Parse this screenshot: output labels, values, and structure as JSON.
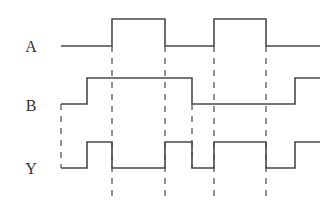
{
  "diagram": {
    "type": "timing-diagram",
    "colors": {
      "line": "#4a4a4a",
      "label": "#333333",
      "background": "#ffffff"
    },
    "signals": [
      {
        "name": "A",
        "label_pos": [
          31,
          52
        ],
        "high_y": 19,
        "low_y": 46,
        "points": [
          [
            61,
            46
          ],
          [
            112,
            46
          ],
          [
            112,
            19
          ],
          [
            165,
            19
          ],
          [
            165,
            46
          ],
          [
            214,
            46
          ],
          [
            214,
            19
          ],
          [
            266,
            19
          ],
          [
            266,
            46
          ],
          [
            320,
            46
          ]
        ],
        "sequence": "0 1 0 1 0"
      },
      {
        "name": "B",
        "label_pos": [
          31,
          111
        ],
        "high_y": 78,
        "low_y": 104,
        "points": [
          [
            61,
            104
          ],
          [
            87,
            104
          ],
          [
            87,
            78
          ],
          [
            192,
            78
          ],
          [
            192,
            104
          ],
          [
            295,
            104
          ],
          [
            295,
            78
          ],
          [
            320,
            78
          ]
        ],
        "sequence": "0 1 0 1"
      },
      {
        "name": "Y",
        "label_pos": [
          31,
          174
        ],
        "high_y": 142,
        "low_y": 168,
        "points": [
          [
            61,
            168
          ],
          [
            87,
            168
          ],
          [
            87,
            142
          ],
          [
            112,
            142
          ],
          [
            112,
            168
          ],
          [
            165,
            168
          ],
          [
            165,
            142
          ],
          [
            192,
            142
          ],
          [
            192,
            168
          ],
          [
            214,
            168
          ],
          [
            214,
            142
          ],
          [
            266,
            142
          ],
          [
            266,
            168
          ],
          [
            295,
            168
          ],
          [
            295,
            142
          ],
          [
            320,
            142
          ]
        ],
        "sequence": "0 1 0 1 0 1 0 1"
      }
    ],
    "dashed_guides": [
      {
        "x": 61,
        "y1": 104,
        "y2": 168
      },
      {
        "x": 112,
        "y1": 46,
        "y2": 198
      },
      {
        "x": 165,
        "y1": 46,
        "y2": 198
      },
      {
        "x": 192,
        "y1": 104,
        "y2": 168
      },
      {
        "x": 214,
        "y1": 46,
        "y2": 198
      },
      {
        "x": 266,
        "y1": 46,
        "y2": 198
      }
    ]
  }
}
